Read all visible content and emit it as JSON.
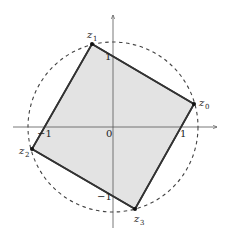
{
  "diagram": {
    "type": "complex-plane-square",
    "colors": {
      "background": "#ffffff",
      "square_fill": "#e3e3e3",
      "square_stroke": "#333333",
      "axis": "#555555",
      "circle": "#444444",
      "vertex": "#111111"
    },
    "axes": {
      "origin_label": "0",
      "x_ticks": [
        {
          "label": "−1",
          "value": -1
        },
        {
          "label": "1",
          "value": 1
        }
      ],
      "y_ticks": [
        {
          "label": "1",
          "value": 1
        },
        {
          "label": "−1",
          "value": -1
        }
      ]
    },
    "circle": {
      "style": "dashed",
      "label": ""
    },
    "vertices": [
      {
        "name": "z",
        "sub": "0"
      },
      {
        "name": "z",
        "sub": "1"
      },
      {
        "name": "z",
        "sub": "2"
      },
      {
        "name": "z",
        "sub": "3"
      }
    ]
  }
}
